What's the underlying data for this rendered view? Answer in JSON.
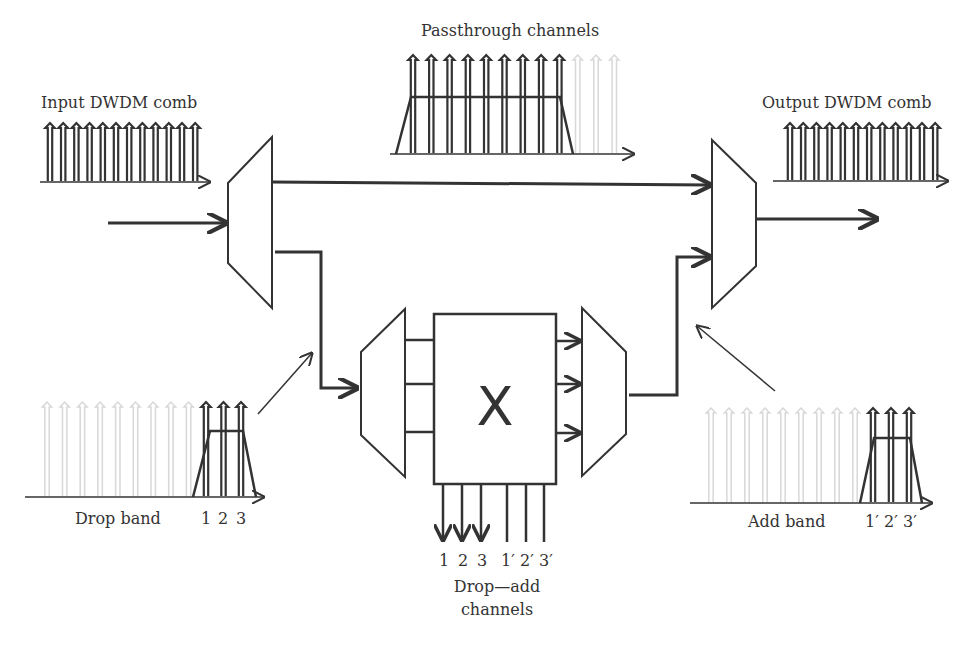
{
  "labels": {
    "input_comb": "Input DWDM comb",
    "output_comb": "Output DWDM comb",
    "passthrough": "Passthrough channels",
    "drop_band": "Drop band",
    "add_band": "Add band",
    "drop_add_line1": "Drop—add",
    "drop_add_line2": "channels",
    "switch_symbol": "X"
  },
  "drop_channels": [
    "1",
    "2",
    "3"
  ],
  "add_channels": [
    "1′",
    "2′",
    "3′"
  ],
  "crossconnect_outputs": [
    "1",
    "2",
    "3",
    "1′",
    "2′",
    "3′"
  ],
  "spectra": {
    "input_comb_count": 12,
    "output_comb_count": 12,
    "passthrough_active": 9,
    "passthrough_faded": 3,
    "drop_faded": 9,
    "drop_active": 3,
    "add_faded": 9,
    "add_active": 3
  },
  "colors": {
    "stroke": "#333333",
    "faded": "#d8d8d8",
    "background": "#ffffff"
  }
}
